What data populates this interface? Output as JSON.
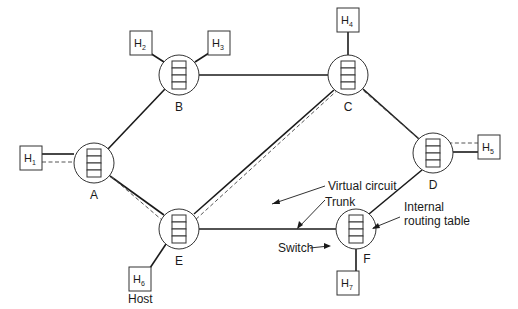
{
  "diagram": {
    "switches": [
      {
        "id": "A",
        "label": "A",
        "cx": 94,
        "cy": 163,
        "lx": 94,
        "ly": 199
      },
      {
        "id": "B",
        "label": "B",
        "cx": 179,
        "cy": 75,
        "lx": 179,
        "ly": 111
      },
      {
        "id": "C",
        "label": "C",
        "cx": 348,
        "cy": 75,
        "lx": 348,
        "ly": 111
      },
      {
        "id": "D",
        "label": "D",
        "cx": 433,
        "cy": 153,
        "lx": 433,
        "ly": 189
      },
      {
        "id": "E",
        "label": "E",
        "cx": 179,
        "cy": 229,
        "lx": 179,
        "ly": 265
      },
      {
        "id": "F",
        "label": "F",
        "cx": 356,
        "cy": 229,
        "lx": 367,
        "ly": 263
      }
    ],
    "hosts": [
      {
        "id": "H1",
        "base": "H",
        "sub": "1",
        "x": 20,
        "y": 146
      },
      {
        "id": "H2",
        "base": "H",
        "sub": "2",
        "x": 130,
        "y": 31
      },
      {
        "id": "H3",
        "base": "H",
        "sub": "3",
        "x": 208,
        "y": 31
      },
      {
        "id": "H4",
        "base": "H",
        "sub": "4",
        "x": 337,
        "y": 8
      },
      {
        "id": "H5",
        "base": "H",
        "sub": "5",
        "x": 478,
        "y": 135
      },
      {
        "id": "H6",
        "base": "H",
        "sub": "6",
        "x": 129,
        "y": 267
      },
      {
        "id": "H7",
        "base": "H",
        "sub": "7",
        "x": 337,
        "y": 271
      }
    ],
    "annotations": {
      "virtual_circuit": "Virtual circuit",
      "trunk": "Trunk",
      "internal_routing_table_line1": "Internal",
      "internal_routing_table_line2": "routing table",
      "switch": "Switch",
      "host": "Host"
    },
    "trunks": [
      [
        "A",
        "B"
      ],
      [
        "B",
        "C"
      ],
      [
        "A",
        "E"
      ],
      [
        "C",
        "E"
      ],
      [
        "C",
        "D"
      ],
      [
        "D",
        "F"
      ],
      [
        "E",
        "F"
      ]
    ],
    "virtual_circuit_path": [
      "H1",
      "A",
      "E",
      "C",
      "D",
      "H5"
    ],
    "colors": {
      "line": "#1a1a1a",
      "dashed": "#555555",
      "background": "#ffffff"
    }
  }
}
